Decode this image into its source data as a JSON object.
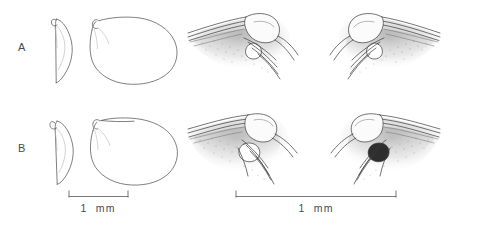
{
  "figure": {
    "type": "scientific-illustration-plate",
    "background_color": "#ffffff",
    "ink_color": "#4a4a4a",
    "width": 485,
    "height": 231
  },
  "rows": [
    {
      "id": "A",
      "label": "A",
      "label_x": 22,
      "label_y": 48,
      "panels": [
        {
          "name": "dorsal-view",
          "caption": ""
        },
        {
          "name": "lateral-valve-outline",
          "caption": ""
        },
        {
          "name": "hinge-detail-left",
          "caption": ""
        },
        {
          "name": "hinge-detail-right",
          "caption": ""
        }
      ]
    },
    {
      "id": "B",
      "label": "B",
      "label_x": 22,
      "label_y": 149,
      "panels": [
        {
          "name": "dorsal-view",
          "caption": ""
        },
        {
          "name": "lateral-valve-outline",
          "caption": ""
        },
        {
          "name": "hinge-detail-left",
          "caption": ""
        },
        {
          "name": "hinge-detail-right",
          "caption": ""
        }
      ]
    }
  ],
  "scalebars": [
    {
      "id": "left",
      "label": "1  mm",
      "x_start": 68,
      "x_end": 128,
      "y": 196,
      "length_px": 60,
      "label_x": 68,
      "label_y": 202,
      "label_width": 60
    },
    {
      "id": "right",
      "label": "1  mm",
      "x_start": 235,
      "x_end": 397,
      "y": 196,
      "length_px": 162,
      "label_x": 235,
      "label_y": 202,
      "label_width": 162
    }
  ]
}
